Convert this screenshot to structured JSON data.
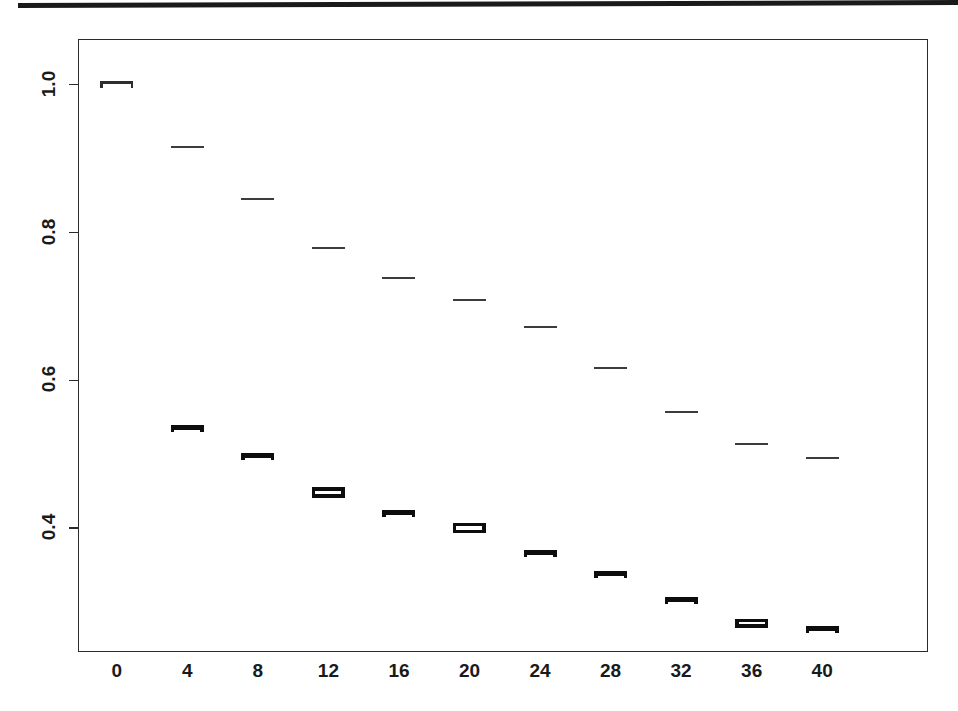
{
  "page": {
    "rule_color": "#1a1a1a",
    "background": "#ffffff"
  },
  "axes": {
    "y_ticks": [
      "1.0",
      "0.8",
      "0.6",
      "0.4"
    ],
    "y_tick_values": [
      1.0,
      0.8,
      0.6,
      0.4
    ],
    "x_ticks": [
      "0",
      "4",
      "8",
      "12",
      "16",
      "20",
      "24",
      "28",
      "32",
      "36",
      "40"
    ],
    "x_tick_values": [
      0,
      4,
      8,
      12,
      16,
      20,
      24,
      28,
      32,
      36,
      40
    ]
  },
  "chart_data": {
    "type": "scatter",
    "title": "",
    "subtitle": "",
    "xlabel": "",
    "ylabel": "",
    "xlim": [
      -2.2,
      46.0
    ],
    "ylim": [
      0.232,
      1.062
    ],
    "grid": false,
    "legend": "none",
    "marker_style": "horizontal-dash-with-error-bars",
    "x": [
      0,
      4,
      8,
      12,
      16,
      20,
      24,
      28,
      32,
      36,
      40
    ],
    "series": [
      {
        "name": "upper",
        "marker": "thin-dash",
        "values": [
          1.0,
          0.916,
          0.846,
          0.779,
          0.739,
          0.708,
          0.672,
          0.616,
          0.557,
          0.513,
          0.495
        ],
        "errors": [
          0.004,
          0.002,
          0.002,
          0.002,
          0.002,
          0.002,
          0.002,
          0.002,
          0.002,
          0.002,
          0.002
        ]
      },
      {
        "name": "lower",
        "marker": "bold-error-bar",
        "values": [
          null,
          0.534,
          0.497,
          0.448,
          0.419,
          0.4,
          0.365,
          0.337,
          0.302,
          0.271,
          0.262
        ],
        "errors": [
          null,
          0.004,
          0.004,
          0.007,
          0.004,
          0.007,
          0.004,
          0.004,
          0.004,
          0.006,
          0.004
        ]
      }
    ]
  }
}
